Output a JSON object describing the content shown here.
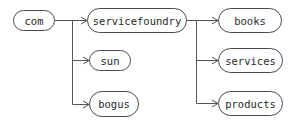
{
  "diagram": {
    "type": "tree",
    "line_color": "#555555",
    "nodes": {
      "com": {
        "label": "com"
      },
      "servicefoundry": {
        "label": "servicefoundry"
      },
      "sun": {
        "label": "sun"
      },
      "bogus": {
        "label": "bogus"
      },
      "books": {
        "label": "books"
      },
      "services": {
        "label": "services"
      },
      "products": {
        "label": "products"
      }
    },
    "edges": [
      {
        "from": "com",
        "to": "servicefoundry"
      },
      {
        "from": "com",
        "to": "sun"
      },
      {
        "from": "com",
        "to": "bogus"
      },
      {
        "from": "servicefoundry",
        "to": "books"
      },
      {
        "from": "servicefoundry",
        "to": "services"
      },
      {
        "from": "servicefoundry",
        "to": "products"
      }
    ]
  }
}
